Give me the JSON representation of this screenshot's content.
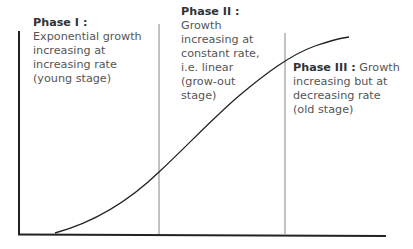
{
  "diagram": {
    "type": "growth-curve",
    "phases": [
      {
        "title": "Phase I :",
        "lines": [
          "Exponential growth",
          "increasing at",
          "increasing rate",
          "(young stage)"
        ]
      },
      {
        "title": "Phase II :",
        "lines": [
          "Growth",
          "increasing at",
          "constant rate,",
          "i.e. linear",
          "(grow-out",
          "stage)"
        ]
      },
      {
        "title": "Phase III :",
        "title_suffix": " Growth",
        "lines": [
          "increasing but at",
          "decreasing rate",
          "(old stage)"
        ]
      }
    ],
    "colors": {
      "axis": "#222222",
      "divider": "#999999",
      "curve": "#222222",
      "text": "#555555",
      "title": "#333333"
    }
  }
}
